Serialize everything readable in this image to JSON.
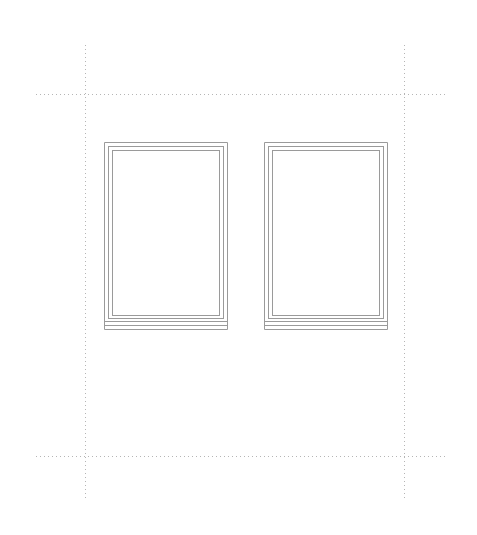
{
  "drawing": {
    "type": "window elevation",
    "line_color": "#9a9a9a",
    "guide_color": "#b5b5b5",
    "guides": {
      "vertical_x": [
        85,
        404
      ],
      "horizontal_y": [
        94,
        456
      ],
      "vertical_extent": [
        45,
        500
      ],
      "horizontal_extent": [
        36,
        446
      ]
    },
    "windows": [
      {
        "id": "left",
        "x": 104,
        "y": 142,
        "width": 123,
        "frame_bottom": 318,
        "sill_bottom": 329
      },
      {
        "id": "right",
        "x": 264,
        "y": 142,
        "width": 123,
        "frame_bottom": 318,
        "sill_bottom": 329
      }
    ]
  }
}
